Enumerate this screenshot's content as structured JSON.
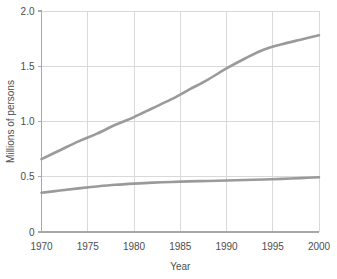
{
  "chart_data": {
    "type": "line",
    "title": "",
    "subtitle": "",
    "xlabel": "Year",
    "ylabel": "Millions of persons",
    "xlim": [
      1970,
      2000
    ],
    "ylim": [
      0,
      2.0
    ],
    "grid": true,
    "legend": "none",
    "x_ticks": [
      "1970",
      "1975",
      "1980",
      "1985",
      "1990",
      "1995",
      "2000"
    ],
    "x_tick_values": [
      1970,
      1975,
      1980,
      1985,
      1990,
      1995,
      2000
    ],
    "y_ticks": [
      "0",
      "0.5",
      "1.0",
      "1.5",
      "2.0"
    ],
    "y_tick_values": [
      0,
      0.5,
      1.0,
      1.5,
      2.0
    ],
    "line_color": "#9a9a9a",
    "grid_color": "#d9d9d9",
    "axis_color": "#a8a8a8",
    "line_width": 2.6,
    "x": [
      1970,
      1972,
      1974,
      1976,
      1978,
      1980,
      1982,
      1984,
      1986,
      1988,
      1990,
      1992,
      1994,
      1996,
      1998,
      2000
    ],
    "series": [
      {
        "name": "upper-series",
        "values": [
          0.66,
          0.74,
          0.82,
          0.89,
          0.97,
          1.04,
          1.12,
          1.2,
          1.29,
          1.38,
          1.48,
          1.57,
          1.65,
          1.7,
          1.74,
          1.78
        ]
      },
      {
        "name": "lower-series",
        "values": [
          0.355,
          0.375,
          0.395,
          0.412,
          0.427,
          0.438,
          0.447,
          0.453,
          0.458,
          0.462,
          0.466,
          0.47,
          0.475,
          0.481,
          0.488,
          0.495
        ]
      }
    ]
  }
}
